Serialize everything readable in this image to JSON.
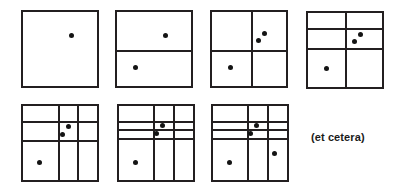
{
  "figure": {
    "caption_text": "(et cetera)",
    "stroke_color": "#231f20",
    "dot_color": "#141414",
    "background_color": "#ffffff"
  },
  "chart_data": {
    "type": "diagram",
    "panel_size": 78,
    "annotations": [
      "(et cetera)"
    ],
    "panels": [
      {
        "index": 1,
        "name": "panel-1",
        "x": 21,
        "y": 10,
        "size": 78,
        "points": [
          {
            "label": "p1",
            "x": 65,
            "y": 32
          }
        ],
        "lines": []
      },
      {
        "index": 2,
        "name": "panel-2",
        "x": 115,
        "y": 10,
        "size": 78,
        "points": [
          {
            "label": "p1",
            "x": 65,
            "y": 32
          },
          {
            "label": "p2",
            "x": 25,
            "y": 75
          }
        ],
        "lines": [
          {
            "orient": "h",
            "pos": 53,
            "from": 0,
            "to": 100
          }
        ]
      },
      {
        "index": 3,
        "name": "panel-3",
        "x": 210,
        "y": 10,
        "size": 78,
        "points": [
          {
            "label": "p1",
            "x": 71,
            "y": 29
          },
          {
            "label": "p2",
            "x": 25,
            "y": 75
          },
          {
            "label": "p3",
            "x": 63,
            "y": 39
          }
        ],
        "lines": [
          {
            "orient": "h",
            "pos": 53,
            "from": 0,
            "to": 100
          },
          {
            "orient": "v",
            "pos": 54,
            "from": 0,
            "to": 100
          }
        ]
      },
      {
        "index": 4,
        "name": "panel-4",
        "x": 306,
        "y": 11,
        "size": 78,
        "points": [
          {
            "label": "p1",
            "x": 71,
            "y": 29
          },
          {
            "label": "p2",
            "x": 25,
            "y": 75
          },
          {
            "label": "p3",
            "x": 63,
            "y": 39
          }
        ],
        "lines": [
          {
            "orient": "h",
            "pos": 22,
            "from": 0,
            "to": 100
          },
          {
            "orient": "h",
            "pos": 48,
            "from": 0,
            "to": 100
          },
          {
            "orient": "v",
            "pos": 52,
            "from": 0,
            "to": 100
          }
        ]
      },
      {
        "index": 5,
        "name": "panel-5",
        "x": 21,
        "y": 104,
        "size": 78,
        "points": [
          {
            "label": "p1",
            "x": 61,
            "y": 28
          },
          {
            "label": "p2",
            "x": 22,
            "y": 77
          },
          {
            "label": "p3",
            "x": 53,
            "y": 38
          }
        ],
        "lines": [
          {
            "orient": "h",
            "pos": 22,
            "from": 0,
            "to": 100
          },
          {
            "orient": "h",
            "pos": 47,
            "from": 0,
            "to": 100
          },
          {
            "orient": "v",
            "pos": 48,
            "from": 0,
            "to": 100
          },
          {
            "orient": "v",
            "pos": 74,
            "from": 0,
            "to": 100
          }
        ]
      },
      {
        "index": 6,
        "name": "panel-6",
        "x": 117,
        "y": 104,
        "size": 78,
        "points": [
          {
            "label": "p1",
            "x": 59,
            "y": 27
          },
          {
            "label": "p2",
            "x": 22,
            "y": 77
          },
          {
            "label": "p3",
            "x": 51,
            "y": 37
          }
        ],
        "lines": [
          {
            "orient": "h",
            "pos": 21,
            "from": 0,
            "to": 100
          },
          {
            "orient": "h",
            "pos": 33,
            "from": 0,
            "to": 100
          },
          {
            "orient": "h",
            "pos": 45,
            "from": 0,
            "to": 100
          },
          {
            "orient": "v",
            "pos": 47,
            "from": 0,
            "to": 100
          },
          {
            "orient": "v",
            "pos": 74,
            "from": 0,
            "to": 100
          }
        ]
      },
      {
        "index": 7,
        "name": "panel-7",
        "x": 211,
        "y": 104,
        "size": 78,
        "points": [
          {
            "label": "p1",
            "x": 59,
            "y": 27
          },
          {
            "label": "p2",
            "x": 22,
            "y": 77
          },
          {
            "label": "p3",
            "x": 51,
            "y": 37
          },
          {
            "label": "p4",
            "x": 83,
            "y": 64
          }
        ],
        "lines": [
          {
            "orient": "h",
            "pos": 21,
            "from": 0,
            "to": 100
          },
          {
            "orient": "h",
            "pos": 33,
            "from": 0,
            "to": 100
          },
          {
            "orient": "h",
            "pos": 45,
            "from": 0,
            "to": 100
          },
          {
            "orient": "v",
            "pos": 47,
            "from": 0,
            "to": 100
          },
          {
            "orient": "v",
            "pos": 74,
            "from": 0,
            "to": 100
          }
        ]
      }
    ],
    "caption": {
      "text": "(et cetera)",
      "x": 311,
      "y": 131
    }
  }
}
